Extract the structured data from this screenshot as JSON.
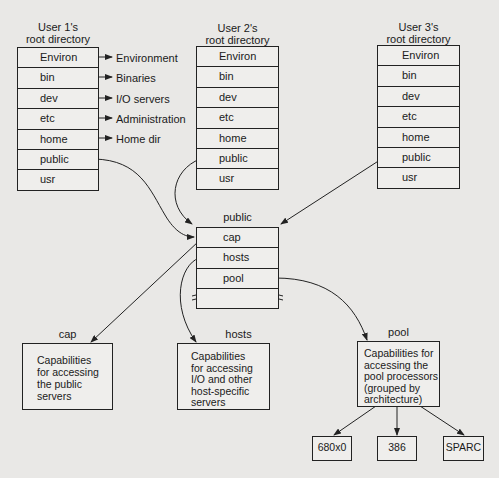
{
  "users": [
    {
      "title_line1": "User 1's",
      "title_line2": "root directory",
      "entries": [
        "Environ",
        "bin",
        "dev",
        "etc",
        "home",
        "public",
        "usr"
      ]
    },
    {
      "title_line1": "User 2's",
      "title_line2": "root directory",
      "entries": [
        "Environ",
        "bin",
        "dev",
        "etc",
        "home",
        "public",
        "usr"
      ]
    },
    {
      "title_line1": "User 3's",
      "title_line2": "root directory",
      "entries": [
        "Environ",
        "bin",
        "dev",
        "etc",
        "home",
        "public",
        "usr"
      ]
    }
  ],
  "user1_targets": [
    "Environment",
    "Binaries",
    "I/O servers",
    "Administration",
    "Home dir"
  ],
  "public_dir": {
    "title": "public",
    "entries": [
      "cap",
      "hosts",
      "pool"
    ]
  },
  "leaf_boxes": {
    "cap": {
      "title": "cap",
      "lines": [
        "Capabilities",
        "for accessing",
        "the public",
        "servers"
      ]
    },
    "hosts": {
      "title": "hosts",
      "lines": [
        "Capabilities",
        "for accessing",
        "I/O and other",
        "host-specific",
        "servers"
      ]
    },
    "pool": {
      "title": "pool",
      "lines": [
        "Capabilities for",
        "accessing the",
        "pool processors",
        "(grouped by",
        "architecture)"
      ]
    }
  },
  "architectures": [
    "680x0",
    "386",
    "SPARC"
  ]
}
